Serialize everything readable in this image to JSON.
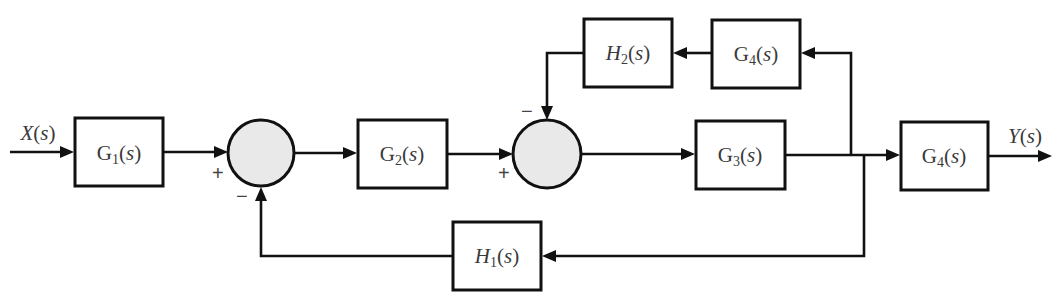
{
  "diagram": {
    "type": "control-system-block-diagram",
    "input": {
      "label": "X(s)"
    },
    "output": {
      "label": "Y(s)"
    },
    "blocks": [
      {
        "id": "G1",
        "name": "G",
        "sub": "1",
        "label": "G1(s)"
      },
      {
        "id": "G2",
        "name": "G",
        "sub": "2",
        "label": "G2(s)"
      },
      {
        "id": "G3",
        "name": "G",
        "sub": "3",
        "label": "G3(s)"
      },
      {
        "id": "G4_out",
        "name": "G",
        "sub": "4",
        "label": "G4(s)"
      },
      {
        "id": "G4_fb",
        "name": "G",
        "sub": "4",
        "label": "G4(s)"
      },
      {
        "id": "H2",
        "name": "H",
        "sub": "2",
        "label": "H2(s)"
      },
      {
        "id": "H1",
        "name": "H",
        "sub": "1",
        "label": "H1(s)"
      }
    ],
    "summing_junctions": [
      {
        "id": "S1",
        "inputs": [
          {
            "from": "G1",
            "sign": "+"
          },
          {
            "from": "H1",
            "sign": "−"
          }
        ]
      },
      {
        "id": "S2",
        "inputs": [
          {
            "from": "G2",
            "sign": "+"
          },
          {
            "from": "H2",
            "sign": "−"
          }
        ]
      }
    ],
    "connections": [
      "X(s) → G1",
      "G1 → S1 (+)",
      "S1 → G2",
      "G2 → S2 (+)",
      "S2 → G3",
      "G3 → G4_out",
      "G4_out → Y(s)",
      "G3 output → G4_fb",
      "G4_fb → H2",
      "H2 → S2 (−)",
      "G3 output → H1",
      "H1 → S1 (−)"
    ],
    "signs": {
      "plus": "+",
      "minus": "−"
    },
    "text_parts": {
      "open": "(",
      "s": "s",
      "close": ")",
      "X": "X",
      "Y": "Y"
    }
  }
}
